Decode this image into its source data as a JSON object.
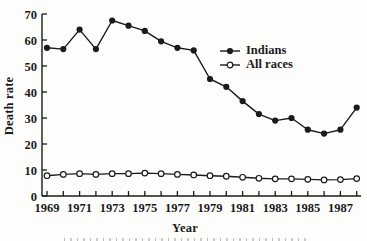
{
  "figure": {
    "background": "#fdfdfb",
    "ink_color": "#1b1b1b"
  },
  "chart_data": {
    "type": "line",
    "title": "",
    "xlabel": "Year",
    "ylabel": "Death rate",
    "x": [
      1969,
      1970,
      1971,
      1972,
      1973,
      1974,
      1975,
      1976,
      1977,
      1978,
      1979,
      1980,
      1981,
      1982,
      1983,
      1984,
      1985,
      1986,
      1987,
      1988
    ],
    "xtick_labels": [
      1969,
      1971,
      1973,
      1975,
      1977,
      1979,
      1981,
      1983,
      1985,
      1987
    ],
    "yticks": [
      0,
      10,
      20,
      30,
      40,
      50,
      60,
      70
    ],
    "ylim": [
      0,
      70
    ],
    "grid": false,
    "legend_position": "inside-upper-right",
    "series": [
      {
        "name": "Indians",
        "marker": "filled-circle",
        "color": "#1b1b1b",
        "values": [
          57,
          56.5,
          64,
          56.5,
          67.5,
          65.5,
          63.5,
          59.5,
          57,
          56,
          45,
          42,
          36.5,
          31.5,
          29,
          30,
          25.5,
          24,
          25.5,
          34
        ]
      },
      {
        "name": "All races",
        "marker": "open-circle",
        "color": "#1b1b1b",
        "values": [
          7.8,
          8.3,
          8.6,
          8.3,
          8.6,
          8.6,
          8.8,
          8.6,
          8.3,
          8.1,
          7.8,
          7.6,
          7.2,
          6.8,
          6.6,
          6.6,
          6.4,
          6.2,
          6.3,
          6.7
        ]
      }
    ]
  }
}
